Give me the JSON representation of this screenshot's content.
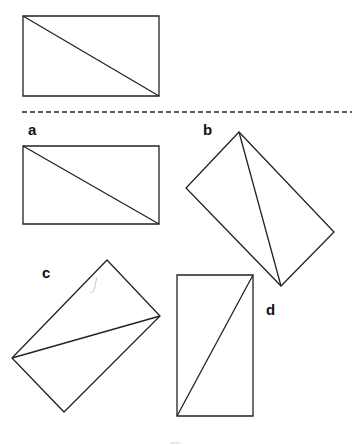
{
  "diagram": {
    "reference": {
      "shape": "rectangle",
      "corners": [
        [
          23,
          16
        ],
        [
          159,
          16
        ],
        [
          159,
          96
        ],
        [
          23,
          96
        ]
      ],
      "diagonal": [
        [
          23,
          16
        ],
        [
          159,
          96
        ]
      ]
    },
    "divider": {
      "style": "dashed",
      "y": 112,
      "x_start": 22,
      "x_end": 352
    },
    "options": [
      {
        "label": "a",
        "label_pos": [
          28,
          122
        ],
        "corners": [
          [
            23,
            146
          ],
          [
            159,
            146
          ],
          [
            159,
            224
          ],
          [
            23,
            224
          ]
        ],
        "diagonal": [
          [
            23,
            146
          ],
          [
            159,
            224
          ]
        ]
      },
      {
        "label": "b",
        "label_pos": [
          203,
          122
        ],
        "corners": [
          [
            239,
            132
          ],
          [
            334,
            232
          ],
          [
            281,
            286
          ],
          [
            186,
            188
          ]
        ],
        "diagonal": [
          [
            239,
            132
          ],
          [
            281,
            286
          ]
        ]
      },
      {
        "label": "c",
        "label_pos": [
          42,
          265
        ],
        "corners": [
          [
            107,
            260
          ],
          [
            160,
            316
          ],
          [
            64,
            412
          ],
          [
            12,
            358
          ]
        ],
        "diagonal": [
          [
            12,
            358
          ],
          [
            160,
            316
          ]
        ]
      },
      {
        "label": "d",
        "label_pos": [
          266,
          302
        ],
        "corners": [
          [
            177,
            275
          ],
          [
            253,
            275
          ],
          [
            253,
            416
          ],
          [
            177,
            416
          ]
        ],
        "diagonal": [
          [
            177,
            416
          ],
          [
            253,
            275
          ]
        ]
      }
    ],
    "stroke_color": "#222222",
    "mark_color": "#bbbbbb"
  }
}
